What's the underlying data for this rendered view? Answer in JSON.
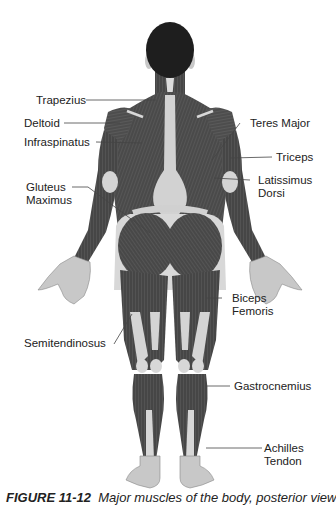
{
  "figure": {
    "caption_number": "FIGURE 11-12",
    "caption_text": "Major muscles of the body, posterior view"
  },
  "labels_left": [
    {
      "id": "trapezius",
      "text": [
        "Trapezius"
      ]
    },
    {
      "id": "deltoid",
      "text": [
        "Deltoid"
      ]
    },
    {
      "id": "infraspinatus",
      "text": [
        "Infraspinatus"
      ]
    },
    {
      "id": "gluteus-maximus",
      "text": [
        "Gluteus",
        "Maximus"
      ]
    },
    {
      "id": "semitendinosus",
      "text": [
        "Semitendinosus"
      ]
    }
  ],
  "labels_right": [
    {
      "id": "teres-major",
      "text": [
        "Teres Major"
      ]
    },
    {
      "id": "triceps",
      "text": [
        "Triceps"
      ]
    },
    {
      "id": "latissimus-dorsi",
      "text": [
        "Latissimus",
        "Dorsi"
      ]
    },
    {
      "id": "biceps-femoris",
      "text": [
        "Biceps",
        "Femoris"
      ]
    },
    {
      "id": "gastrocnemius",
      "text": [
        "Gastrocnemius"
      ]
    },
    {
      "id": "achilles-tendon",
      "text": [
        "Achilles",
        "Tendon"
      ]
    }
  ],
  "colors": {
    "muscle": "#4a4a4a",
    "muscle_dark": "#333333",
    "tendon": "#d4d4d4",
    "skin": "#c8c8c8",
    "hair": "#1e1e1e",
    "leader_line": "#444444",
    "text": "#222222"
  }
}
